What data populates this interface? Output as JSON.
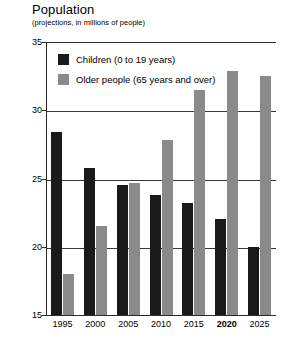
{
  "chart_data": {
    "type": "bar",
    "title": "Population",
    "subtitle": "(projections, in millions of people)",
    "xlabel": "",
    "ylabel": "",
    "ylim": [
      15,
      35
    ],
    "yticks": [
      15,
      20,
      25,
      30,
      35
    ],
    "ytick_labels": [
      "15",
      "20",
      "25",
      "30",
      "35"
    ],
    "grid": true,
    "grid_axis": "y",
    "legend_position": "inside-top-left",
    "categories": [
      "1995",
      "2000",
      "2005",
      "2010",
      "2015",
      "2020",
      "2025"
    ],
    "highlight_category": "2020",
    "series": [
      {
        "name": "Children (0 to 19 years)",
        "color": "#1a1a1a",
        "values": [
          28.4,
          25.8,
          24.5,
          23.8,
          23.2,
          22.0,
          20.0
        ]
      },
      {
        "name": "Older people (65 years and over)",
        "color": "#8a8a8a",
        "values": [
          18.0,
          21.5,
          24.7,
          27.8,
          31.5,
          32.9,
          32.5
        ]
      }
    ]
  },
  "legend": {
    "items": [
      {
        "label": "Children (0 to 19 years)",
        "color": "#1a1a1a"
      },
      {
        "label": "Older people (65 years and over)",
        "color": "#8a8a8a"
      }
    ]
  }
}
